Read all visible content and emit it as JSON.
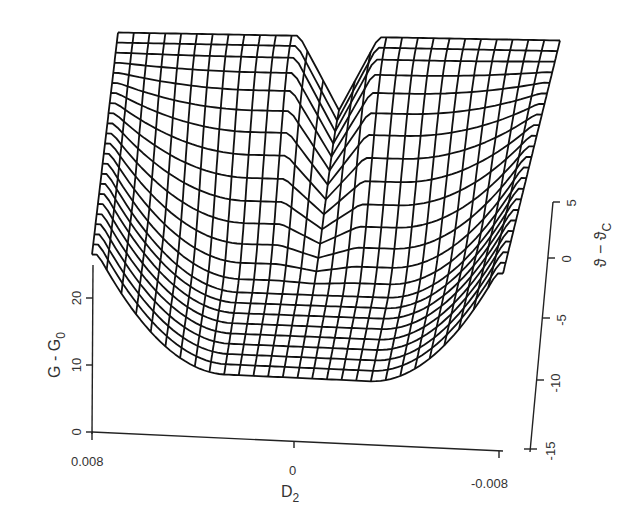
{
  "chart_data": {
    "type": "surface3d-wireframe",
    "title": "",
    "axes": {
      "x": {
        "label": "D₂",
        "label_main": "D",
        "label_sub": "2",
        "ticks": [
          0.008,
          0,
          -0.008
        ],
        "tick_labels": [
          "0.008",
          "0",
          "-0.008"
        ],
        "range": [
          0.008,
          -0.008
        ]
      },
      "y": {
        "label": "ϑ − ϑc",
        "label_main": "ϑ − ϑ",
        "label_sub": "C",
        "ticks": [
          5,
          0,
          -5,
          -10,
          -15
        ],
        "tick_labels": [
          "5",
          "0",
          "-5",
          "-10",
          "-15"
        ],
        "range": [
          -15,
          5
        ]
      },
      "z": {
        "label": "G - G₀",
        "label_main": "G - G",
        "label_sub": "0",
        "ticks": [
          0,
          10,
          20
        ],
        "tick_labels": [
          "0",
          "10",
          "20"
        ],
        "range": [
          0,
          25
        ]
      }
    },
    "surface_samples": {
      "d2": [
        0.008,
        0.004,
        0.0,
        -0.004,
        -0.008
      ],
      "theta": [
        5,
        0,
        -5,
        -10
      ],
      "z": [
        [
          25,
          25,
          14,
          25,
          25
        ],
        [
          24,
          20,
          12,
          20,
          24
        ],
        [
          20,
          10,
          9,
          10,
          20
        ],
        [
          14,
          8,
          8,
          8,
          14
        ]
      ]
    },
    "grid": false,
    "legend": null
  },
  "axis_labels": {
    "g_axis": {
      "main": "G - G",
      "sub": "0"
    },
    "theta_axis": {
      "main": "ϑ − ϑ",
      "sub": "C"
    },
    "d2_axis": {
      "main": "D",
      "sub": "2"
    }
  },
  "tick_labels": {
    "g": [
      "0",
      "10",
      "20"
    ],
    "theta": [
      "5",
      "0",
      "-5",
      "-10",
      "-15"
    ],
    "d2": [
      "0.008",
      "0",
      "-0.008"
    ]
  }
}
